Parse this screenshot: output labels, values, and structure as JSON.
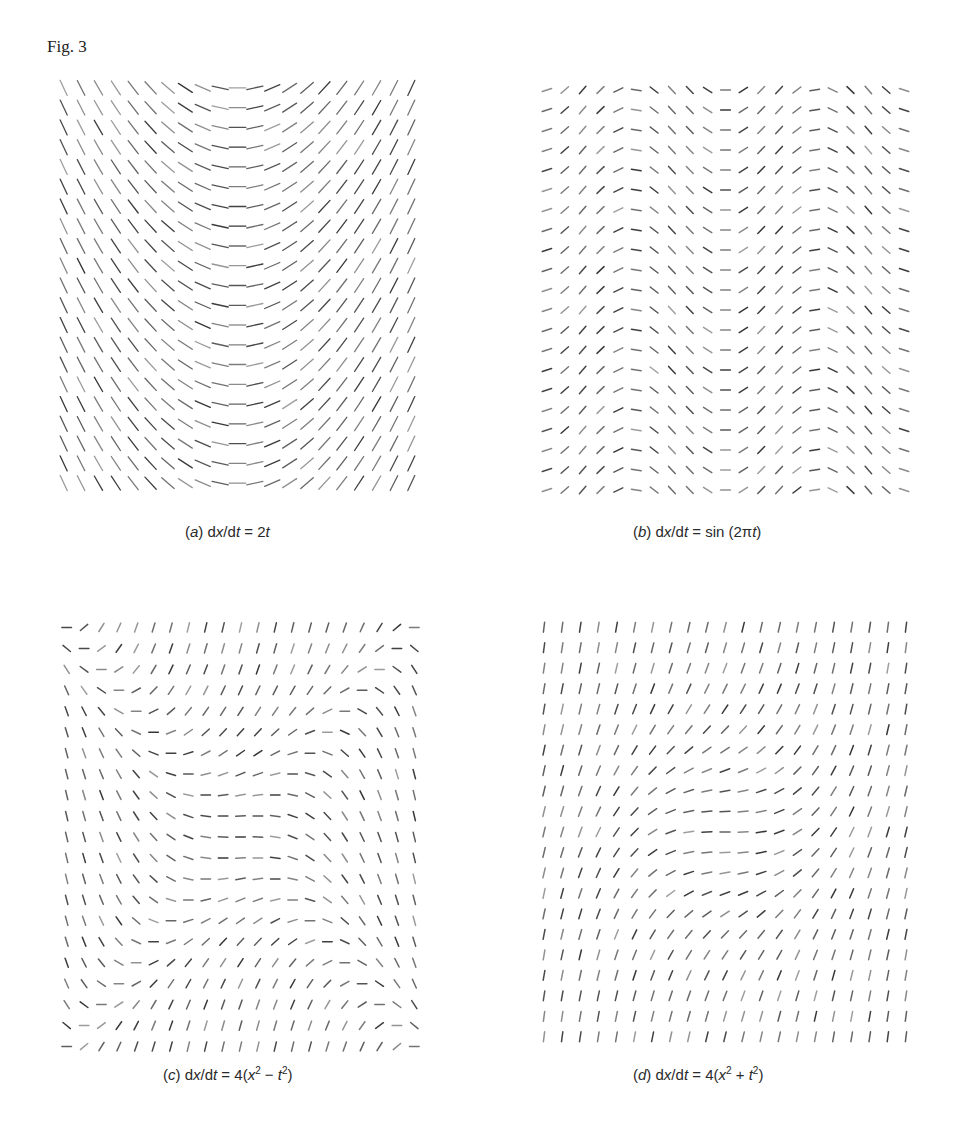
{
  "figure": {
    "label": "Fig. 3"
  },
  "panels": [
    {
      "id": "a",
      "tag": "a",
      "equation_text": "dx/dt = 2t",
      "caption_parts": [
        "(",
        "a",
        ")  d",
        "x",
        "/d",
        "t",
        " = 2",
        "t"
      ],
      "field": "2t",
      "grid": {
        "cols": 21,
        "rows": 21
      },
      "domain": {
        "t": [
          -1.0,
          1.0
        ],
        "x": [
          -1.0,
          1.0
        ]
      },
      "box": {
        "left": 55,
        "top": 78,
        "width": 365,
        "height": 415
      },
      "caption_pos": {
        "left": 185,
        "top": 523
      }
    },
    {
      "id": "b",
      "tag": "b",
      "equation_text": "dx/dt = sin (2πt)",
      "caption_parts": [
        "(",
        "b",
        ")  d",
        "x",
        "/d",
        "t",
        " = sin (2π",
        "t",
        ")"
      ],
      "field": "sin(2pi t)",
      "grid": {
        "cols": 21,
        "rows": 21
      },
      "domain": {
        "t": [
          0.0,
          2.0
        ],
        "x": [
          -1.0,
          1.0
        ]
      },
      "box": {
        "left": 538,
        "top": 80,
        "width": 375,
        "height": 420
      },
      "caption_pos": {
        "left": 633,
        "top": 523
      }
    },
    {
      "id": "c",
      "tag": "c",
      "equation_text": "dx/dt = 4(x² − t²)",
      "caption_parts": [
        "(",
        "c",
        ")  d",
        "x",
        "/d",
        "t",
        " = 4(",
        "x",
        "2",
        " − ",
        "t",
        "2",
        ")"
      ],
      "field": "4(x^2 - t^2)",
      "grid": {
        "cols": 21,
        "rows": 21
      },
      "domain": {
        "t": [
          -1.0,
          1.0
        ],
        "x": [
          -1.0,
          1.0
        ]
      },
      "box": {
        "left": 58,
        "top": 617,
        "width": 365,
        "height": 440
      },
      "caption_pos": {
        "left": 163,
        "top": 1066
      }
    },
    {
      "id": "d",
      "tag": "d",
      "equation_text": "dx/dt = 4(x² + t²)",
      "caption_parts": [
        "(",
        "d",
        ")  d",
        "x",
        "/d",
        "t",
        " = 4(",
        "x",
        "2",
        " + ",
        "t",
        "2",
        ")"
      ],
      "field": "4(x^2 + t^2)",
      "grid": {
        "cols": 21,
        "rows": 21
      },
      "domain": {
        "t": [
          -1.0,
          1.0
        ],
        "x": [
          -1.0,
          1.0
        ]
      },
      "box": {
        "left": 535,
        "top": 617,
        "width": 380,
        "height": 430
      },
      "caption_pos": {
        "left": 633,
        "top": 1066
      }
    }
  ],
  "style": {
    "ink": "#2b2b2b",
    "background": "#ffffff"
  }
}
